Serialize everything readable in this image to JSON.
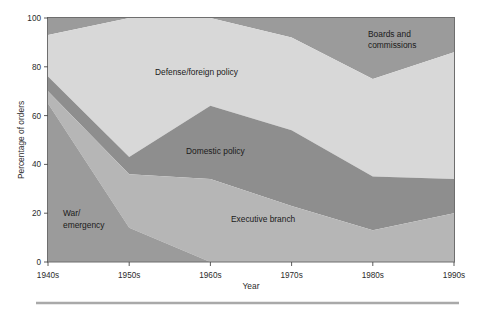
{
  "chart_data": {
    "type": "area",
    "title": "",
    "subtitle": "",
    "xlabel": "Year",
    "ylabel": "Percentage of orders",
    "categories": [
      "1940s",
      "1950s",
      "1960s",
      "1970s",
      "1980s",
      "1990s"
    ],
    "x": [
      1940,
      1950,
      1960,
      1970,
      1980,
      1990
    ],
    "xtick_labels": [
      "1940s",
      "1950s",
      "1960s",
      "1970s",
      "1980s",
      "1990s"
    ],
    "ytick_labels": [
      "0",
      "20",
      "40",
      "60",
      "80",
      "100"
    ],
    "yticks": [
      0,
      20,
      40,
      60,
      80,
      100
    ],
    "ylim": [
      0,
      100
    ],
    "xlim": [
      1940,
      1990
    ],
    "grid": false,
    "legend": "inline-labels",
    "stacked": true,
    "stack_order_bottom_to_top": [
      "War/emergency",
      "Executive branch",
      "Domestic policy",
      "Defense/foreign policy",
      "Boards and commissions"
    ],
    "series": [
      {
        "name": "War/emergency",
        "color": "#9b9b9b",
        "values": [
          65,
          14,
          0,
          0,
          0,
          0
        ],
        "label_text": "War/\nemergency",
        "label_line1": "War/",
        "label_line2": "emergency"
      },
      {
        "name": "Executive branch",
        "color": "#b6b6b6",
        "values": [
          5,
          22,
          34,
          23,
          13,
          20
        ],
        "label_text": "Executive branch"
      },
      {
        "name": "Domestic policy",
        "color": "#8e8e8e",
        "values": [
          6,
          7,
          30,
          31,
          22,
          14
        ],
        "label_text": "Domestic policy"
      },
      {
        "name": "Defense/foreign policy",
        "color": "#d8d8d8",
        "values": [
          17,
          57,
          36,
          38,
          40,
          52
        ],
        "label_text": "Defense/foreign policy"
      },
      {
        "name": "Boards and commissions",
        "color": "#9b9b9b",
        "values": [
          7,
          0,
          0,
          8,
          25,
          14
        ],
        "label_text": "Boards and commissions",
        "label_line1": "Boards and",
        "label_line2": "commissions"
      }
    ],
    "cumulative_boundaries": {
      "war_emergency_top": [
        65,
        14,
        0,
        0,
        0,
        0
      ],
      "executive_branch_top": [
        70,
        36,
        34,
        23,
        13,
        20
      ],
      "domestic_policy_top": [
        76,
        43,
        64,
        54,
        35,
        34
      ],
      "defense_foreign_top": [
        93,
        100,
        100,
        92,
        75,
        86
      ],
      "boards_commissions_top": [
        100,
        100,
        100,
        100,
        100,
        100
      ]
    }
  },
  "axis": {
    "y_title": "Percentage of orders",
    "x_title": "Year",
    "y_ticks": [
      "100",
      "80",
      "60",
      "40",
      "20",
      "0"
    ],
    "x_ticks": [
      "1940s",
      "1950s",
      "1960s",
      "1970s",
      "1980s",
      "1990s"
    ]
  },
  "labels": {
    "boards_line1": "Boards and",
    "boards_line2": "commissions",
    "defense": "Defense/foreign policy",
    "domestic": "Domestic policy",
    "executive": "Executive branch",
    "war_line1": "War/",
    "war_line2": "emergency"
  },
  "colors": {
    "war_emergency": "#9b9b9b",
    "executive_branch": "#b6b6b6",
    "domestic_policy": "#8e8e8e",
    "defense_foreign": "#d8d8d8",
    "boards_commissions": "#9b9b9b",
    "frame": "#6e6e6e",
    "text": "#1a1a1a",
    "rule": "#a9a9a9",
    "background": "#ffffff"
  }
}
